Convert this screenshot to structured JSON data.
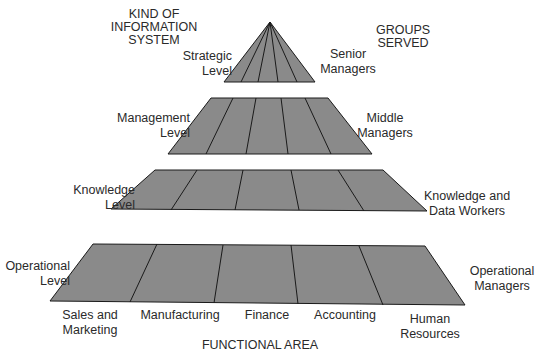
{
  "headers": {
    "left": [
      "KIND OF",
      "INFORMATION",
      "SYSTEM"
    ],
    "right": [
      "GROUPS",
      "SERVED"
    ],
    "bottom": "FUNCTIONAL AREA"
  },
  "levels": [
    {
      "name": [
        "Strategic",
        "Level"
      ],
      "group": [
        "Senior",
        "Managers"
      ]
    },
    {
      "name": [
        "Management",
        "Level"
      ],
      "group": [
        "Middle",
        "Managers"
      ]
    },
    {
      "name": [
        "Knowledge",
        "Level"
      ],
      "group": [
        "Knowledge and",
        "Data Workers"
      ]
    },
    {
      "name": [
        "Operational",
        "Level"
      ],
      "group": [
        "Operational",
        "Managers"
      ]
    }
  ],
  "functional_areas": [
    [
      "Sales and",
      "Marketing"
    ],
    [
      "Manufacturing"
    ],
    [
      "Finance"
    ],
    [
      "Accounting"
    ],
    [
      "Human",
      "Resources"
    ]
  ],
  "colors": {
    "tier_fill": "#8a8a8a",
    "tier_stroke": "#1a1a1a"
  }
}
